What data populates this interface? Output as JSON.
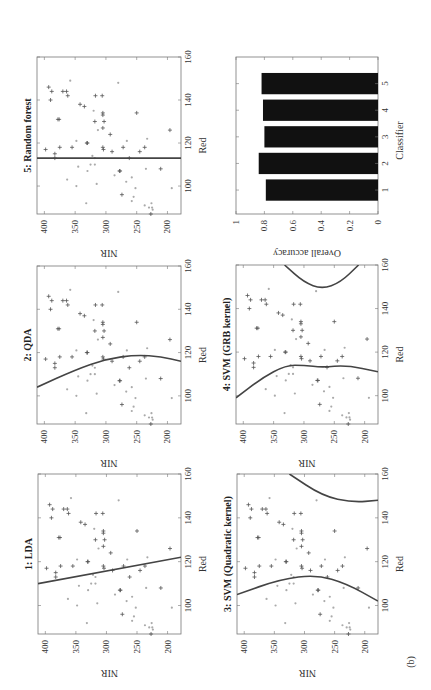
{
  "figure_label": "(b)",
  "chart_data": [
    {
      "type": "scatter",
      "title": "1: LDA",
      "xlabel": "Red",
      "ylabel": "NIR",
      "xlim": [
        87,
        160
      ],
      "ylim": [
        178,
        412
      ],
      "xticks": [
        100,
        120,
        140,
        160
      ],
      "yticks": [
        400,
        350,
        300,
        250,
        200
      ],
      "boundary": "linear",
      "boundary_points": [
        [
          110,
          412
        ],
        [
          122,
          178
        ]
      ],
      "grid": false
    },
    {
      "type": "scatter",
      "title": "2: QDA",
      "xlabel": "Red",
      "ylabel": "NIR",
      "xlim": [
        87,
        160
      ],
      "ylim": [
        178,
        412
      ],
      "xticks": [
        100,
        120,
        140,
        160
      ],
      "yticks": [
        400,
        350,
        300,
        250,
        200
      ],
      "boundary": "quadratic",
      "boundary_points": [
        [
          104,
          412
        ],
        [
          112,
          350
        ],
        [
          117,
          300
        ],
        [
          119,
          250
        ],
        [
          118,
          210
        ],
        [
          116,
          178
        ]
      ],
      "grid": false
    },
    {
      "type": "scatter",
      "title": "3: SVM (Quadratic kernel)",
      "xlabel": "Red",
      "ylabel": "NIR",
      "xlim": [
        87,
        160
      ],
      "ylim": [
        178,
        412
      ],
      "xticks": [
        100,
        120,
        140,
        160
      ],
      "yticks": [
        400,
        350,
        300,
        250,
        200
      ],
      "boundary": "quadratic-two-branch",
      "boundary_points": [
        [
          105,
          412
        ],
        [
          112,
          340
        ],
        [
          114,
          280
        ],
        [
          110,
          230
        ],
        [
          102,
          178
        ]
      ],
      "boundary_points_2": [
        [
          160,
          325
        ],
        [
          150,
          270
        ],
        [
          147,
          220
        ],
        [
          148,
          178
        ]
      ],
      "grid": false
    },
    {
      "type": "scatter",
      "title": "4: SVM (GRB kernel)",
      "xlabel": "Red",
      "ylabel": "NIR",
      "xlim": [
        87,
        160
      ],
      "ylim": [
        178,
        412
      ],
      "xticks": [
        100,
        120,
        140,
        160
      ],
      "yticks": [
        400,
        350,
        300,
        250,
        200
      ],
      "boundary": "rbf",
      "boundary_points": [
        [
          99,
          412
        ],
        [
          108,
          370
        ],
        [
          114,
          330
        ],
        [
          114,
          300
        ],
        [
          113,
          270
        ],
        [
          114,
          230
        ],
        [
          111,
          178
        ]
      ],
      "boundary_points_2": [
        [
          160,
          332
        ],
        [
          152,
          300
        ],
        [
          149,
          270
        ],
        [
          152,
          240
        ],
        [
          160,
          210
        ]
      ],
      "grid": false
    },
    {
      "type": "scatter",
      "title": "5: Random forest",
      "xlabel": "Red",
      "ylabel": "NIR",
      "xlim": [
        87,
        160
      ],
      "ylim": [
        178,
        412
      ],
      "xticks": [
        100,
        120,
        140,
        160
      ],
      "yticks": [
        400,
        350,
        300,
        250,
        200
      ],
      "boundary": "threshold",
      "boundary_points": [
        [
          113,
          412
        ],
        [
          113,
          178
        ]
      ],
      "grid": false
    },
    {
      "type": "bar",
      "title": "",
      "xlabel": "Classifier",
      "ylabel": "Overall accuracy",
      "categories": [
        "1",
        "2",
        "3",
        "4",
        "5"
      ],
      "values": [
        0.79,
        0.84,
        0.8,
        0.81,
        0.82
      ],
      "ylim": [
        0,
        1
      ],
      "yticks": [
        0,
        0.2,
        0.4,
        0.6,
        0.8,
        1
      ],
      "grid": false
    }
  ],
  "points": {
    "class_a_plus": [
      [
        146,
        393
      ],
      [
        144,
        388
      ],
      [
        140,
        390
      ],
      [
        144,
        370
      ],
      [
        144,
        364
      ],
      [
        142,
        362
      ],
      [
        131,
        378
      ],
      [
        131,
        376
      ],
      [
        138,
        342
      ],
      [
        137,
        335
      ],
      [
        142,
        317
      ],
      [
        142,
        306
      ],
      [
        134,
        305
      ],
      [
        133,
        305
      ],
      [
        130,
        303
      ],
      [
        130,
        318
      ],
      [
        127,
        305
      ],
      [
        134,
        250
      ],
      [
        126,
        196
      ],
      [
        124,
        293
      ],
      [
        120,
        330
      ],
      [
        120,
        331
      ],
      [
        118,
        355
      ],
      [
        118,
        375
      ],
      [
        117,
        398
      ],
      [
        115,
        383
      ],
      [
        113,
        383
      ],
      [
        118,
        305
      ],
      [
        117,
        304
      ],
      [
        116,
        290
      ],
      [
        118,
        272
      ],
      [
        118,
        237
      ],
      [
        116,
        245
      ],
      [
        113,
        262
      ],
      [
        107,
        277
      ],
      [
        107,
        278
      ],
      [
        108,
        211
      ],
      [
        96,
        274
      ],
      [
        87,
        227
      ]
    ],
    "class_b_dot": [
      [
        149,
        358
      ],
      [
        148,
        280
      ],
      [
        135,
        320
      ],
      [
        126,
        313
      ],
      [
        121,
        348
      ],
      [
        121,
        266
      ],
      [
        122,
        233
      ],
      [
        114,
        322
      ],
      [
        113,
        318
      ],
      [
        110,
        325
      ],
      [
        110,
        318
      ],
      [
        109,
        345
      ],
      [
        108,
        235
      ],
      [
        107,
        330
      ],
      [
        105,
        286
      ],
      [
        104,
        258
      ],
      [
        103,
        363
      ],
      [
        102,
        267
      ],
      [
        101,
        315
      ],
      [
        100,
        348
      ],
      [
        99,
        252
      ],
      [
        99,
        193
      ],
      [
        95,
        255
      ],
      [
        93,
        258
      ],
      [
        92,
        332
      ],
      [
        91,
        237
      ],
      [
        90,
        225
      ],
      [
        90,
        230
      ],
      [
        89,
        224
      ],
      [
        92,
        226
      ]
    ]
  }
}
